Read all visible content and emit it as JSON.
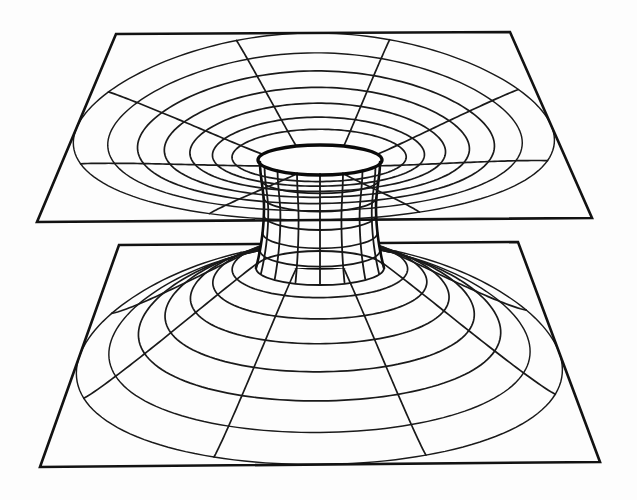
{
  "figure": {
    "style": {
      "background": "#fdfdfd",
      "ink": "#121212",
      "line_width_grid": 1.7,
      "line_width_edge": 2.6,
      "line_width_rim": 3.4
    },
    "canvas": {
      "width": 637,
      "height": 500
    }
  },
  "geometry": {
    "upper_sheet": {
      "name": "upper-universe-sheet",
      "corners": {
        "top_left": [
          116,
          34
        ],
        "top_right": [
          510,
          32
        ],
        "bottom_right": [
          592,
          218
        ],
        "bottom_left": [
          37,
          222
        ]
      },
      "center": [
        320,
        128
      ],
      "funnel_direction": "down",
      "rim_center": [
        320,
        160
      ],
      "rim_rx": 62,
      "rim_ry": 15,
      "throat_depth": 46,
      "radial_count": 8,
      "ring_count": 7,
      "ring_radii_fraction": [
        0.12,
        0.22,
        0.34,
        0.48,
        0.63,
        0.8,
        1.0
      ],
      "perspective_squash": 0.325
    },
    "lower_sheet": {
      "name": "lower-universe-sheet",
      "corners": {
        "top_left": [
          119,
          245
        ],
        "top_right": [
          518,
          242
        ],
        "bottom_right": [
          600,
          462
        ],
        "bottom_left": [
          40,
          467
        ]
      },
      "center": [
        320,
        345
      ],
      "funnel_direction": "up",
      "rim_center": [
        320,
        252
      ],
      "rim_rx": 60,
      "rim_ry": 16,
      "throat_depth": 40,
      "radial_count": 8,
      "ring_count": 7,
      "ring_radii_fraction": [
        0.13,
        0.23,
        0.35,
        0.49,
        0.64,
        0.81,
        1.0
      ],
      "perspective_squash": 0.345
    },
    "tube": {
      "name": "wormhole-throat-tube",
      "top_center": [
        320,
        162
      ],
      "bottom_center": [
        320,
        268
      ],
      "top_half_width": 60,
      "waist_half_width": 56,
      "bottom_half_width": 64,
      "waist_y_fraction": 0.42,
      "ellipse_ry_top": 13,
      "ellipse_ry_bottom": 17,
      "vertical_line_count": 8,
      "horizontal_ring_count": 5
    }
  },
  "chart_data": {
    "type": "line",
    "xlabel": "",
    "ylabel": "",
    "series": [
      {
        "name": "upper sheet boundary",
        "values": [
          116,
          34,
          510,
          32,
          592,
          218,
          37,
          222
        ]
      },
      {
        "name": "lower sheet boundary",
        "values": [
          119,
          245,
          518,
          242,
          600,
          462,
          40,
          467
        ]
      },
      {
        "name": "upper funnel rings",
        "values": [
          0.12,
          0.22,
          0.34,
          0.48,
          0.63,
          0.8,
          1.0
        ]
      },
      {
        "name": "lower funnel rings",
        "values": [
          0.13,
          0.23,
          0.35,
          0.49,
          0.64,
          0.81,
          1.0
        ]
      },
      {
        "name": "throat tube widths",
        "values": [
          60,
          56,
          64
        ]
      }
    ],
    "legend": "none",
    "grid": true
  }
}
